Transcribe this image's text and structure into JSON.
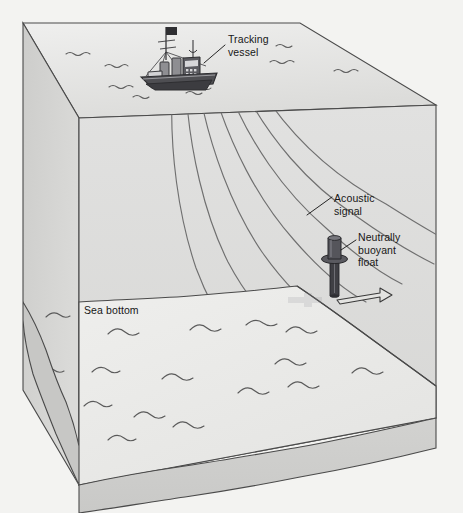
{
  "diagram": {
    "type": "isometric-3d-block-diagram",
    "labels": {
      "tracking_vessel": "Tracking\nvessel",
      "acoustic_signal": "Acoustic\nsignal",
      "neutrally_buoyant_float": "Neutrally\nbuoyant\nfloat",
      "sea_bottom": "Sea bottom"
    },
    "colors": {
      "background": "#f3f3f1",
      "water_front_face": "#dbdbdb",
      "water_side_face": "#cfcfcf",
      "sea_surface_top": "#e6e6e4",
      "seabed_top": "#ebebe9",
      "sediment_front": "#cfcfcf",
      "sediment_side": "#c4c4c4",
      "outline": "#4a4a4a",
      "vessel_body": "#4e4e52",
      "vessel_light": "#9a9a9e",
      "float_body": "#3f3f44",
      "float_collar": "#5a5a60",
      "wave_mark": "#555555",
      "arc_stroke": "#6b6b6b",
      "leader_line": "#1a1a1a",
      "text": "#171717"
    },
    "elements": {
      "acoustic_arc_count": 7,
      "sea_surface_wave_marks": 9,
      "sea_bottom_wave_marks": 16,
      "vessel_position": "upper-left of sea surface",
      "float_position": "right side, above sloping sea bottom",
      "direction_arrow": "points right, below float",
      "seabed_slope": "descends from left plateau toward lower right"
    }
  }
}
